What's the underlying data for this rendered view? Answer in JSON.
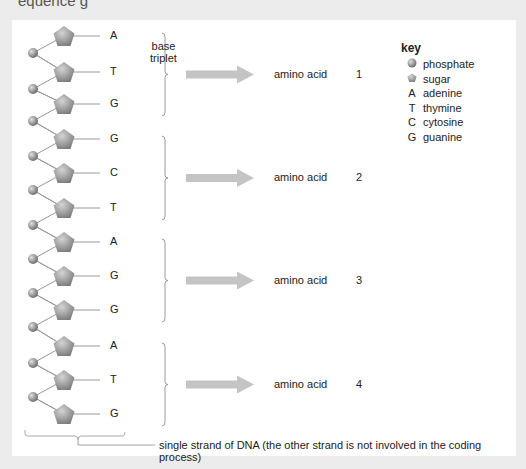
{
  "heading_fragment": "equence  g",
  "strand": {
    "bases": [
      "A",
      "T",
      "G",
      "G",
      "C",
      "T",
      "A",
      "G",
      "G",
      "A",
      "T",
      "G"
    ],
    "triplet_label": "base\ntriplet",
    "caption": "single strand of DNA (the other strand is not involved in the coding process)"
  },
  "codons": [
    {
      "label": "amino acid",
      "number": "1"
    },
    {
      "label": "amino acid",
      "number": "2"
    },
    {
      "label": "amino acid",
      "number": "3"
    },
    {
      "label": "amino acid",
      "number": "4"
    }
  ],
  "key": {
    "title": "key",
    "items": [
      {
        "symbol": "phosphate-icon",
        "label": "phosphate"
      },
      {
        "symbol": "sugar-icon",
        "label": "sugar"
      },
      {
        "symbol": "A",
        "label": "adenine"
      },
      {
        "symbol": "T",
        "label": "thymine"
      },
      {
        "symbol": "C",
        "label": "cytosine"
      },
      {
        "symbol": "G",
        "label": "guanine"
      }
    ]
  },
  "colors": {
    "background": "#ececec",
    "panel": "#ffffff",
    "arrow": "#c4c4c4",
    "sugar": "#8c8c8c",
    "phosphate": "#888888",
    "line": "#999999"
  }
}
